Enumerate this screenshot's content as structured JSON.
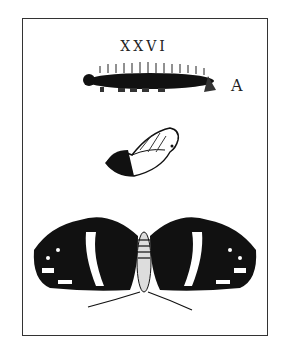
{
  "plate": {
    "number": "XXVI",
    "letter": "A",
    "subjects": [
      "caterpillar",
      "chrysalis",
      "butterfly"
    ]
  }
}
